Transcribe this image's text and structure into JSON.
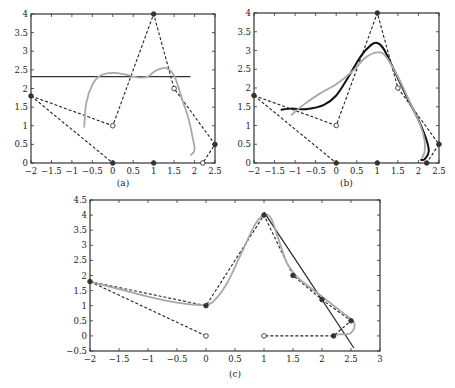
{
  "figure": {
    "panels": [
      {
        "id": "a",
        "caption": "(a)"
      },
      {
        "id": "b",
        "caption": "(b)"
      },
      {
        "id": "c",
        "caption": "(c)"
      }
    ]
  },
  "chart_data": [
    {
      "panel": "(a)",
      "type": "line",
      "xlim": [
        -2,
        2.5
      ],
      "ylim": [
        0,
        4
      ],
      "xticks": [
        "-2",
        "-1.5",
        "-1",
        "-0.5",
        "0",
        "0.5",
        "1",
        "1.5",
        "2",
        "2.5"
      ],
      "yticks": [
        "0",
        "0.5",
        "1",
        "1.5",
        "2",
        "2.5",
        "3",
        "3.5",
        "4"
      ],
      "grid": false,
      "series": [
        {
          "name": "control polygon (dashed)",
          "style": "dashed",
          "color": "#222222",
          "points": [
            [
              -2,
              1.8
            ],
            [
              0,
              1
            ],
            [
              1,
              4
            ],
            [
              1.5,
              2
            ],
            [
              2.5,
              0.5
            ],
            [
              2.2,
              0
            ]
          ]
        },
        {
          "name": "secondary polygon (dashed)",
          "style": "dashed",
          "color": "#222222",
          "points": [
            [
              -2,
              1.8
            ],
            [
              0,
              0
            ]
          ]
        },
        {
          "name": "horizontal line",
          "style": "solid",
          "color": "#333333",
          "points": [
            [
              -2,
              2.32
            ],
            [
              1.9,
              2.32
            ]
          ]
        },
        {
          "name": "approximating curve",
          "style": "solid",
          "color": "#a8a8a8",
          "points": [
            [
              -0.7,
              0.95
            ],
            [
              -0.65,
              1.6
            ],
            [
              -0.5,
              2.1
            ],
            [
              -0.3,
              2.35
            ],
            [
              0,
              2.42
            ],
            [
              0.3,
              2.38
            ],
            [
              0.6,
              2.3
            ],
            [
              0.85,
              2.32
            ],
            [
              1.05,
              2.48
            ],
            [
              1.3,
              2.55
            ],
            [
              1.5,
              2.35
            ],
            [
              1.7,
              1.7
            ],
            [
              1.85,
              1.2
            ],
            [
              1.95,
              0.7
            ],
            [
              2.0,
              0.35
            ],
            [
              1.9,
              0.2
            ]
          ]
        },
        {
          "name": "filled markers",
          "points": [
            [
              -2,
              1.8
            ],
            [
              1,
              4
            ],
            [
              2.5,
              0.5
            ],
            [
              0,
              0
            ],
            [
              1,
              0
            ]
          ]
        },
        {
          "name": "open markers",
          "points": [
            [
              0,
              1
            ],
            [
              1.5,
              2
            ],
            [
              2.2,
              0
            ]
          ]
        }
      ]
    },
    {
      "panel": "(b)",
      "type": "line",
      "xlim": [
        -2,
        2.5
      ],
      "ylim": [
        0,
        4
      ],
      "xticks": [
        "-2",
        "-1.5",
        "-1",
        "-0.5",
        "0",
        "0.5",
        "1",
        "1.5",
        "2",
        "2.5"
      ],
      "yticks": [
        "0",
        "0.5",
        "1",
        "1.5",
        "2",
        "2.5",
        "3",
        "3.5",
        "4"
      ],
      "grid": false,
      "series": [
        {
          "name": "control polygon (dashed)",
          "style": "dashed",
          "color": "#222222",
          "points": [
            [
              -2,
              1.8
            ],
            [
              0,
              1
            ],
            [
              1,
              4
            ],
            [
              1.5,
              2
            ],
            [
              2.5,
              0.5
            ],
            [
              2.2,
              0
            ]
          ]
        },
        {
          "name": "secondary polygon (dashed)",
          "style": "dashed",
          "color": "#222222",
          "points": [
            [
              -2,
              1.8
            ],
            [
              0,
              0
            ]
          ]
        },
        {
          "name": "dark curve",
          "style": "solid",
          "color": "#111111",
          "points": [
            [
              -1.35,
              1.42
            ],
            [
              -1.1,
              1.45
            ],
            [
              -0.7,
              1.44
            ],
            [
              -0.3,
              1.55
            ],
            [
              0,
              1.8
            ],
            [
              0.3,
              2.3
            ],
            [
              0.6,
              2.85
            ],
            [
              0.85,
              3.15
            ],
            [
              1.0,
              3.2
            ],
            [
              1.15,
              3.05
            ],
            [
              1.4,
              2.5
            ],
            [
              1.7,
              1.8
            ],
            [
              2.0,
              1.15
            ],
            [
              2.2,
              0.6
            ],
            [
              2.25,
              0.3
            ],
            [
              2.15,
              0.1
            ],
            [
              2.05,
              0.08
            ]
          ]
        },
        {
          "name": "gray curve",
          "style": "solid",
          "color": "#a8a8a8",
          "points": [
            [
              -1.1,
              1.27
            ],
            [
              -0.8,
              1.55
            ],
            [
              -0.4,
              1.85
            ],
            [
              0,
              2.1
            ],
            [
              0.4,
              2.45
            ],
            [
              0.7,
              2.8
            ],
            [
              1.0,
              2.95
            ],
            [
              1.2,
              2.85
            ],
            [
              1.5,
              2.3
            ],
            [
              1.8,
              1.6
            ],
            [
              2.05,
              1.0
            ],
            [
              2.15,
              0.6
            ],
            [
              2.15,
              0.3
            ],
            [
              2.08,
              0.12
            ]
          ]
        },
        {
          "name": "filled markers",
          "points": [
            [
              -2,
              1.8
            ],
            [
              1,
              4
            ],
            [
              2.5,
              0.5
            ],
            [
              0,
              0
            ],
            [
              1,
              0
            ],
            [
              2.2,
              0
            ]
          ]
        },
        {
          "name": "open markers",
          "points": [
            [
              0,
              1
            ],
            [
              1.5,
              2
            ]
          ]
        }
      ]
    },
    {
      "panel": "(c)",
      "type": "line",
      "xlim": [
        -2,
        3
      ],
      "ylim": [
        -0.5,
        4.5
      ],
      "xticks": [
        "-2",
        "-1.5",
        "-1",
        "-0.5",
        "0",
        "0.5",
        "1",
        "1.5",
        "2",
        "2.5",
        "3"
      ],
      "yticks": [
        "-0.5",
        "0",
        "0.5",
        "1",
        "1.5",
        "2",
        "2.5",
        "3",
        "3.5",
        "4",
        "4.5"
      ],
      "grid": false,
      "series": [
        {
          "name": "control polygon (dashed)",
          "style": "dashed",
          "color": "#222222",
          "points": [
            [
              -2,
              1.8
            ],
            [
              0,
              1
            ],
            [
              1,
              4
            ],
            [
              1.5,
              2
            ],
            [
              2,
              1.2
            ],
            [
              2.5,
              0.5
            ],
            [
              2.2,
              0
            ],
            [
              1,
              0
            ]
          ]
        },
        {
          "name": "secondary polygon (dashed)",
          "style": "dashed",
          "color": "#222222",
          "points": [
            [
              -2,
              1.8
            ],
            [
              0,
              0
            ]
          ]
        },
        {
          "name": "tangent line",
          "style": "solid",
          "color": "#222222",
          "points": [
            [
              1.0,
              4.1
            ],
            [
              2.55,
              -0.4
            ]
          ]
        },
        {
          "name": "gray curve",
          "style": "solid",
          "color": "#a8a8a8",
          "points": [
            [
              -2,
              1.8
            ],
            [
              -1.5,
              1.55
            ],
            [
              -1.0,
              1.3
            ],
            [
              -0.5,
              1.1
            ],
            [
              -0.1,
              1.02
            ],
            [
              0.1,
              1.1
            ],
            [
              0.35,
              1.7
            ],
            [
              0.6,
              2.7
            ],
            [
              0.85,
              3.7
            ],
            [
              1.0,
              4.0
            ],
            [
              1.12,
              3.9
            ],
            [
              1.25,
              3.2
            ],
            [
              1.4,
              2.4
            ],
            [
              1.6,
              1.9
            ],
            [
              2.0,
              1.3
            ],
            [
              2.3,
              0.85
            ],
            [
              2.55,
              0.45
            ],
            [
              2.5,
              0.1
            ],
            [
              2.3,
              0.05
            ],
            [
              2.2,
              0.02
            ]
          ]
        },
        {
          "name": "filled markers",
          "points": [
            [
              -2,
              1.8
            ],
            [
              0,
              1
            ],
            [
              1,
              4
            ],
            [
              1.5,
              2
            ],
            [
              2,
              1.2
            ],
            [
              2.5,
              0.5
            ],
            [
              2.2,
              0
            ]
          ]
        },
        {
          "name": "open markers",
          "points": [
            [
              0,
              0
            ],
            [
              1,
              0
            ]
          ]
        }
      ]
    }
  ]
}
